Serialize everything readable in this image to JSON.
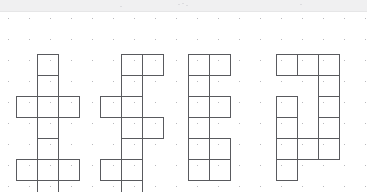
{
  "page": {
    "background_color": "#ffffff",
    "header_band_color": "#f0f0f1",
    "line_color": "#595a5e",
    "dot_color": "#b9b9bd",
    "width": 367,
    "height": 192
  },
  "grid": {
    "type": "dot-grid",
    "cell_size": 21,
    "dot_radius": 1,
    "origin_x": 8,
    "origin_y": 6,
    "columns": 18,
    "rows": 9
  },
  "figures": [
    {
      "id": "net-1",
      "label": "Net 1",
      "position": "top-row-1",
      "shape_name": "cross",
      "square_count": 6,
      "origin": [
        16,
        2
      ],
      "cells": [
        [
          1,
          0
        ],
        [
          1,
          1
        ],
        [
          0,
          2
        ],
        [
          1,
          2
        ],
        [
          2,
          2
        ],
        [
          1,
          3
        ]
      ]
    },
    {
      "id": "net-2",
      "label": "Net 2",
      "position": "top-row-2",
      "shape_name": "offset-zigzag",
      "square_count": 6,
      "origin": [
        100,
        2
      ],
      "cells": [
        [
          1,
          0
        ],
        [
          2,
          0
        ],
        [
          1,
          1
        ],
        [
          0,
          2
        ],
        [
          1,
          2
        ],
        [
          1,
          3
        ]
      ]
    },
    {
      "id": "net-3",
      "label": "Net 3",
      "position": "top-row-3",
      "shape_name": "column-with-two-wings",
      "square_count": 6,
      "origin": [
        188,
        2
      ],
      "cells": [
        [
          0,
          0
        ],
        [
          1,
          0
        ],
        [
          0,
          1
        ],
        [
          0,
          2
        ],
        [
          1,
          2
        ],
        [
          0,
          3
        ]
      ]
    },
    {
      "id": "net-4",
      "label": "Net 4",
      "position": "top-row-4",
      "shape_name": "L-shape",
      "square_count": 5,
      "origin": [
        276,
        2
      ],
      "cells": [
        [
          0,
          0
        ],
        [
          1,
          0
        ],
        [
          2,
          0
        ],
        [
          2,
          1
        ],
        [
          2,
          2
        ],
        [
          2,
          3
        ]
      ]
    },
    {
      "id": "net-5",
      "label": "Net 5",
      "position": "bottom-row-1",
      "shape_name": "cross",
      "square_count": 6,
      "origin": [
        16,
        5
      ],
      "cells": [
        [
          1,
          0
        ],
        [
          1,
          1
        ],
        [
          0,
          2
        ],
        [
          1,
          2
        ],
        [
          2,
          2
        ],
        [
          1,
          3
        ]
      ]
    },
    {
      "id": "net-6",
      "label": "Net 6",
      "position": "bottom-row-2",
      "shape_name": "offset-zigzag",
      "square_count": 6,
      "origin": [
        100,
        5
      ],
      "cells": [
        [
          1,
          0
        ],
        [
          2,
          0
        ],
        [
          1,
          1
        ],
        [
          0,
          2
        ],
        [
          1,
          2
        ],
        [
          1,
          3
        ]
      ]
    },
    {
      "id": "net-7",
      "label": "Net 7",
      "position": "bottom-row-3",
      "shape_name": "P-shape",
      "square_count": 5,
      "origin": [
        188,
        5
      ],
      "cells": [
        [
          0,
          0
        ],
        [
          0,
          1
        ],
        [
          1,
          1
        ],
        [
          0,
          2
        ],
        [
          1,
          2
        ]
      ]
    },
    {
      "id": "net-8",
      "label": "Net 8",
      "position": "bottom-row-4",
      "shape_name": "T-stem",
      "square_count": 6,
      "origin": [
        276,
        4
      ],
      "cells": [
        [
          0,
          0
        ],
        [
          0,
          1
        ],
        [
          0,
          2
        ],
        [
          1,
          2
        ],
        [
          2,
          2
        ],
        [
          0,
          3
        ]
      ]
    }
  ]
}
